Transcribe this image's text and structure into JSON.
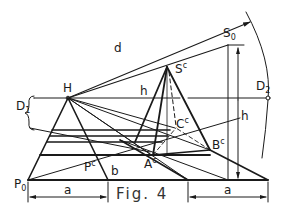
{
  "figure": {
    "caption": "Fig. 4",
    "colors": {
      "ink": "#1a1a1a",
      "background": "#ffffff"
    }
  },
  "labels": {
    "d": "d",
    "S0_main": "S",
    "S0_sub": "0",
    "Sc_main": "S",
    "Sc_sup": "c",
    "H": "H",
    "h_horizon": "h",
    "D1_main": "D",
    "D1_sub": "1",
    "D2_main": "D",
    "D2_sub": "2",
    "h_height": "h",
    "Cc_main": "C",
    "Cc_sup": "c",
    "Bc_main": "B",
    "Bc_sup": "c",
    "Ac_main": "A",
    "Ac_sup": "c",
    "Pc_main": "P",
    "Pc_sup": "c",
    "b": "b",
    "P0_main": "P",
    "P0_sub": "0",
    "a_left": "a",
    "a_right": "a"
  }
}
